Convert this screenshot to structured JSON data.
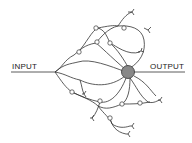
{
  "diagram": {
    "labels": {
      "input": "INPUT",
      "output": "OUTPUT"
    },
    "center_node_color": "#888888",
    "line_color": "#333333"
  }
}
